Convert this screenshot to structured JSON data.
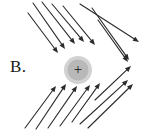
{
  "figure": {
    "label": "B.",
    "width": 155,
    "height": 132,
    "background_color": "#ffffff",
    "line_color": "#2b2b2b"
  },
  "charge": {
    "sign": "+",
    "polarity": "positive",
    "center_x": 78,
    "center_y": 70,
    "radius": 14,
    "fill_color": "#b8b8b8",
    "halo_color": "#d2d2d2",
    "sign_color": "#111111"
  },
  "field_lines": {
    "stroke_width": 1.1,
    "arrowhead_length": 6,
    "arrowhead_width": 5,
    "incoming": [
      {
        "x1": 33,
        "y1": 3,
        "x2": 65,
        "y2": 49
      },
      {
        "x1": 42,
        "y1": 2,
        "x2": 75,
        "y2": 44
      },
      {
        "x1": 52,
        "y1": 4,
        "x2": 84,
        "y2": 42
      },
      {
        "x1": 63,
        "y1": 6,
        "x2": 95,
        "y2": 45
      },
      {
        "x1": 28,
        "y1": 13,
        "x2": 58,
        "y2": 53
      },
      {
        "x1": 25,
        "y1": 128,
        "x2": 56,
        "y2": 86
      },
      {
        "x1": 36,
        "y1": 129,
        "x2": 66,
        "y2": 84
      },
      {
        "x1": 48,
        "y1": 128,
        "x2": 77,
        "y2": 86
      },
      {
        "x1": 60,
        "y1": 126,
        "x2": 90,
        "y2": 85
      },
      {
        "x1": 72,
        "y1": 122,
        "x2": 100,
        "y2": 83
      }
    ],
    "outgoing": [
      {
        "x1": 80,
        "y1": 4,
        "x2": 139,
        "y2": 42
      },
      {
        "x1": 92,
        "y1": 8,
        "x2": 129,
        "y2": 60
      },
      {
        "x1": 98,
        "y1": 20,
        "x2": 128,
        "y2": 62
      },
      {
        "x1": 95,
        "y1": 100,
        "x2": 131,
        "y2": 66
      },
      {
        "x1": 80,
        "y1": 124,
        "x2": 128,
        "y2": 80
      },
      {
        "x1": 88,
        "y1": 128,
        "x2": 133,
        "y2": 84
      }
    ]
  },
  "caption": {
    "description": "Electric field lines around a positive point charge"
  }
}
